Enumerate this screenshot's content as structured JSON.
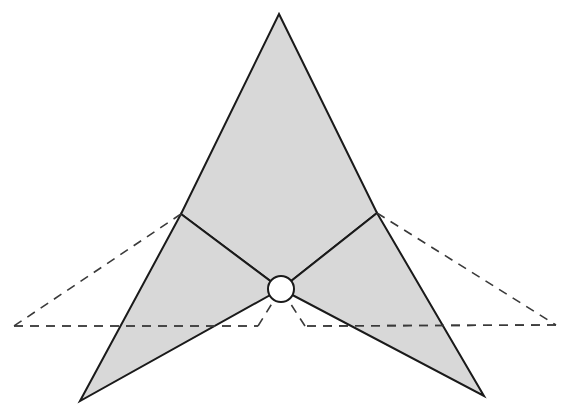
{
  "diagram": {
    "title": "",
    "colors": {
      "fill": "#d4d4d4",
      "stroke": "#1a1a1a",
      "dashed": "#3a3a3a",
      "joint_fill": "#ffffff",
      "background": "#ffffff"
    },
    "points": {
      "apex": [
        279,
        14
      ],
      "left_upper": [
        181,
        214
      ],
      "right_upper": [
        377,
        213
      ],
      "center": [
        281,
        289
      ],
      "left_tip": [
        80,
        401
      ],
      "right_tip": [
        484,
        396
      ],
      "left_dash_corner": [
        14,
        326
      ],
      "right_dash_corner": [
        556,
        325
      ],
      "left_dash_inner": [
        258,
        326
      ],
      "right_dash_inner": [
        305,
        326
      ]
    },
    "joint_radius": 13,
    "shapes": [
      {
        "name": "upper-kite",
        "kind": "filled-polygon",
        "vertices": [
          "apex",
          "right_upper",
          "center",
          "left_upper"
        ]
      },
      {
        "name": "left-wing",
        "kind": "filled-polygon",
        "vertices": [
          "left_upper",
          "center",
          "left_tip"
        ]
      },
      {
        "name": "right-wing",
        "kind": "filled-polygon",
        "vertices": [
          "right_upper",
          "right_tip",
          "center"
        ]
      }
    ],
    "dashed_lines": [
      {
        "name": "left-upper-dash",
        "from": "left_upper",
        "to": "left_dash_corner"
      },
      {
        "name": "left-base-dash",
        "from": "left_dash_corner",
        "to": "left_dash_inner"
      },
      {
        "name": "left-inner-dash",
        "from": "left_dash_inner",
        "to": "center"
      },
      {
        "name": "right-upper-dash",
        "from": "right_upper",
        "to": "right_dash_corner"
      },
      {
        "name": "right-base-dash",
        "from": "right_dash_corner",
        "to": "right_dash_inner"
      },
      {
        "name": "right-inner-dash",
        "from": "right_dash_inner",
        "to": "center"
      }
    ]
  }
}
